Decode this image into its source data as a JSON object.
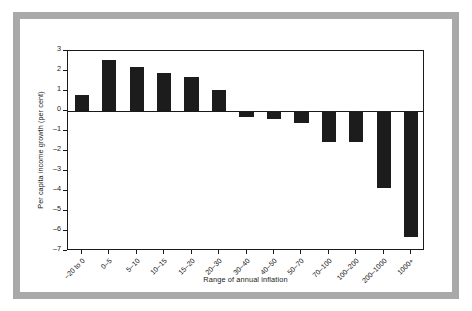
{
  "figure": {
    "frame_color": "#a9a9a9",
    "background_color": "#ffffff",
    "bar_color": "#1c1c1c",
    "axis_color": "#1a1a1a"
  },
  "chart_data": {
    "type": "bar",
    "title": "",
    "subtitle": "",
    "xlabel": "Range of annual inflation",
    "ylabel": "Per capita income growth (per cent)",
    "categories": [
      "–20 to 0",
      "0–5",
      "5–10",
      "10–15",
      "15–20",
      "20–30",
      "30–40",
      "40–50",
      "50–70",
      "70–100",
      "100–200",
      "200–1000",
      "1000+"
    ],
    "values": [
      0.78,
      2.55,
      2.22,
      1.9,
      1.7,
      1.05,
      -0.3,
      -0.42,
      -0.6,
      -1.55,
      -1.55,
      -3.85,
      -6.3
    ],
    "ylim": [
      -7,
      3
    ],
    "yticks": [
      3,
      2,
      1,
      0,
      -1,
      -2,
      -3,
      -4,
      -5,
      -6,
      -7
    ],
    "ytick_labels": [
      "3",
      "2",
      "1",
      "0",
      "–1",
      "–2",
      "–3",
      "–4",
      "–5",
      "–6",
      "–7"
    ],
    "grid": false,
    "legend": null,
    "legend_position": "none",
    "xtick_rotation": -45
  }
}
